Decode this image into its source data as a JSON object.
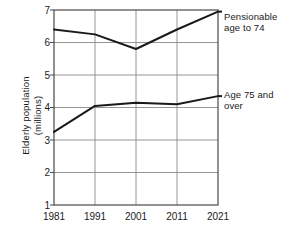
{
  "chart_data": {
    "type": "line",
    "title": "",
    "subtitle": "",
    "xlabel": "",
    "ylabel": "Elderly population\n(millions)",
    "x": [
      1981,
      1991,
      2001,
      2011,
      2021
    ],
    "xticklabels": [
      "1981",
      "1991",
      "2001",
      "2011",
      "2021"
    ],
    "yticklabels": [
      "1",
      "2",
      "3",
      "4",
      "5",
      "6",
      "7"
    ],
    "ylim": [
      1,
      7
    ],
    "xlim": [
      1981,
      2021
    ],
    "grid": true,
    "legend_position": "right-inline",
    "series": [
      {
        "name": "Pensionable age to 74",
        "values": [
          6.4,
          6.25,
          5.8,
          6.4,
          6.95
        ],
        "color": "#1a1a1a"
      },
      {
        "name": "Age 75 and over",
        "values": [
          3.25,
          4.05,
          4.15,
          4.1,
          4.35
        ],
        "color": "#1a1a1a"
      }
    ],
    "annotations": [
      {
        "text": "Pensionable\nage to 74",
        "series": "Pensionable age to 74"
      },
      {
        "text": "Age 75 and\nover",
        "series": "Age 75 and over"
      }
    ]
  },
  "axis": {
    "y_title": "Elderly population\n(millions)",
    "y_ticks": [
      "7",
      "6",
      "5",
      "4",
      "3",
      "2",
      "1"
    ],
    "x_ticks": [
      "1981",
      "1991",
      "2001",
      "2011",
      "2021"
    ]
  },
  "labels": {
    "series_top_line1": "Pensionable",
    "series_top_line2": "age to 74",
    "series_bottom_line1": "Age 75 and",
    "series_bottom_line2": "over"
  },
  "colors": {
    "line": "#1a1a1a",
    "grid": "#8a8a8a",
    "frame": "#4a4a4a",
    "background": "#ffffff"
  }
}
